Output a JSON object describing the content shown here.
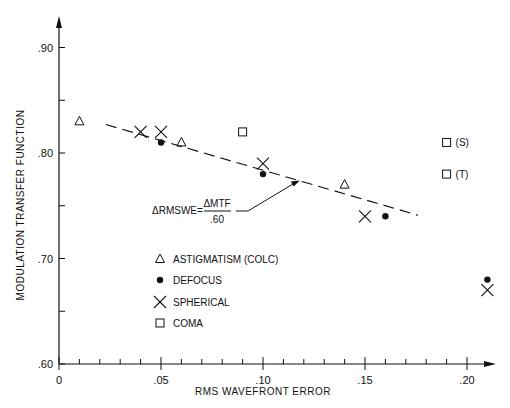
{
  "chart_data": {
    "type": "scatter",
    "title": "",
    "xlabel": "RMS WAVEFRONT ERROR",
    "ylabel": "MODULATION TRANSFER FUNCTION",
    "xlim": [
      0,
      0.21
    ],
    "ylim": [
      0.6,
      0.92
    ],
    "x_ticks": [
      "0",
      ".05",
      ".10",
      ".15",
      ".20"
    ],
    "y_ticks": [
      ".60",
      ".70",
      ".80",
      ".90"
    ],
    "grid": false,
    "legend_position": "inside-left",
    "series": [
      {
        "name": "ASTIGMATISM (COLC)",
        "marker": "triangle",
        "points": [
          [
            0.01,
            0.83
          ],
          [
            0.06,
            0.81
          ],
          [
            0.14,
            0.77
          ]
        ]
      },
      {
        "name": "DEFOCUS",
        "marker": "filled-circle",
        "points": [
          [
            0.05,
            0.81
          ],
          [
            0.1,
            0.78
          ],
          [
            0.16,
            0.74
          ],
          [
            0.21,
            0.68
          ]
        ]
      },
      {
        "name": "SPHERICAL",
        "marker": "x",
        "points": [
          [
            0.04,
            0.82
          ],
          [
            0.05,
            0.82
          ],
          [
            0.1,
            0.79
          ],
          [
            0.15,
            0.74
          ],
          [
            0.21,
            0.67
          ]
        ]
      },
      {
        "name": "COMA",
        "marker": "square",
        "points": [
          [
            0.09,
            0.82
          ],
          [
            0.19,
            0.81
          ],
          [
            0.19,
            0.78
          ]
        ]
      }
    ],
    "coma_point_labels": [
      {
        "x": 0.19,
        "y": 0.81,
        "text": "(S)"
      },
      {
        "x": 0.19,
        "y": 0.78,
        "text": "(T)"
      }
    ],
    "fit_line": {
      "style": "dashed",
      "from": [
        0.023,
        0.827
      ],
      "to": [
        0.176,
        0.741
      ]
    },
    "annotation": {
      "prefix": "ΔRMSWE=",
      "numerator": "ΔMTF",
      "denominator": ".60",
      "arrow_to": [
        0.118,
        0.774
      ]
    }
  }
}
